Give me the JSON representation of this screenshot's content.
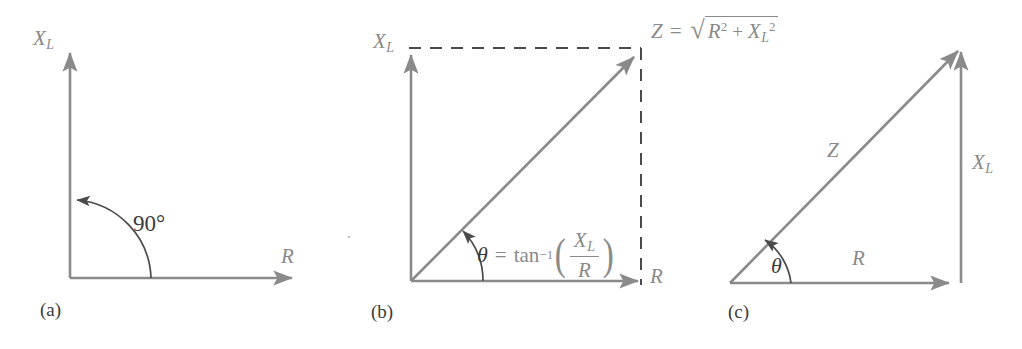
{
  "figure": {
    "stroke_color": "#8a8a8a",
    "text_color": "#8a8a8a",
    "caption_color": "#3b3b3b",
    "angle_color": "#3a3a3a",
    "background": "#ffffff"
  },
  "panels": [
    {
      "id": "a",
      "caption": "(a)",
      "axis_y_label": "X",
      "axis_y_sub": "L",
      "axis_x_label": "R",
      "angle_label": "90°"
    },
    {
      "id": "b",
      "caption": "(b)",
      "axis_y_label": "X",
      "axis_y_sub": "L",
      "axis_x_label": "R",
      "magnitude": {
        "lhs": "Z",
        "equals": "=",
        "radical_sign": "√",
        "radicand_first": "R",
        "radicand_first_exp": "2",
        "radicand_plus": "+",
        "radicand_second": "X",
        "radicand_second_sub": "L",
        "radicand_second_exp": "2"
      },
      "angle_equation": {
        "theta": "θ",
        "equals": "=",
        "fn": "tan",
        "fn_exp": "−1",
        "paren_open": "(",
        "numerator": "X",
        "numerator_sub": "L",
        "denominator": "R",
        "paren_close": ")"
      }
    },
    {
      "id": "c",
      "caption": "(c)",
      "hypotenuse_label": "Z",
      "vertical_label": "X",
      "vertical_sub": "L",
      "base_label": "R",
      "angle_label": "θ"
    }
  ]
}
